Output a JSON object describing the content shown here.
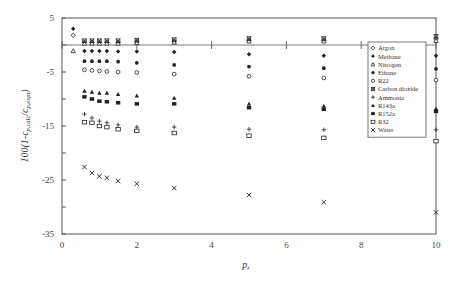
{
  "chart_data": {
    "type": "scatter",
    "title": "",
    "xlabel": "p r",
    "ylabel": "100(1-c p,calc/c p,expt)",
    "xlim": [
      0,
      10
    ],
    "ylim": [
      -35,
      5
    ],
    "x_ticks": [
      "0",
      "2",
      "4",
      "6",
      "8",
      "10"
    ],
    "y_ticks": [
      "5",
      "-5",
      "-15",
      "-25",
      "-35"
    ],
    "grid": false,
    "legend_position": "upper right inside",
    "reference_line_y": 0,
    "series": [
      {
        "name": "Argon",
        "marker": "open-diamond",
        "x": [
          0.3,
          0.6,
          0.8,
          1.0,
          1.2,
          1.5,
          2.0,
          3,
          5,
          7,
          10
        ],
        "y": [
          1.8,
          0.5,
          0.5,
          0.5,
          0.5,
          0.5,
          0.6,
          0.7,
          0.9,
          0.9,
          1.1
        ]
      },
      {
        "name": "Methane",
        "marker": "filled-diamond",
        "x": [
          0.3,
          0.6,
          0.8,
          1.0,
          1.2,
          1.5,
          2.0,
          3,
          5,
          7,
          10
        ],
        "y": [
          3.0,
          -1.1,
          -1.1,
          -1.1,
          -1.1,
          -1.2,
          -1.2,
          -1.3,
          -1.7,
          -2.0,
          -2.0
        ]
      },
      {
        "name": "Nitrogen",
        "marker": "open-triangle",
        "x": [
          0.3,
          0.6,
          0.8,
          1.0,
          1.2,
          1.5,
          2.0,
          3,
          5,
          7,
          10
        ],
        "y": [
          -1.1,
          0.3,
          0.3,
          0.3,
          0.3,
          0.3,
          0.4,
          0.5,
          0.7,
          0.7,
          0.8
        ]
      },
      {
        "name": "Ethane",
        "marker": "filled-circle",
        "x": [
          0.6,
          0.8,
          1.0,
          1.2,
          1.5,
          2.0,
          3,
          5,
          7,
          10
        ],
        "y": [
          -3.0,
          -3.0,
          -3.0,
          -3.0,
          -3.1,
          -3.3,
          -3.7,
          -4.0,
          -4.3,
          -4.4
        ]
      },
      {
        "name": "R22",
        "marker": "open-circle",
        "x": [
          0.6,
          0.8,
          1.0,
          1.2,
          1.5,
          2.0,
          3,
          5,
          7,
          10
        ],
        "y": [
          -4.6,
          -4.7,
          -4.8,
          -4.9,
          -5.0,
          -5.1,
          -5.4,
          -5.8,
          -6.1,
          -6.5
        ]
      },
      {
        "name": "Carbon dioxide",
        "marker": "asterisk",
        "x": [
          0.6,
          0.8,
          1.0,
          1.2,
          1.5,
          2.0,
          3,
          5,
          7,
          10
        ],
        "y": [
          0.8,
          0.8,
          0.8,
          0.8,
          0.8,
          0.9,
          1.0,
          1.2,
          1.2,
          1.6
        ]
      },
      {
        "name": "Ammonia",
        "marker": "plus",
        "x": [
          0.6,
          0.8,
          1.0,
          1.2,
          1.5,
          2.0,
          3,
          5,
          7,
          10
        ],
        "y": [
          -12.8,
          -13.5,
          -14.1,
          -14.4,
          -14.8,
          -15.2,
          -15.2,
          -15.6,
          -15.7,
          -15.7
        ]
      },
      {
        "name": "R143a",
        "marker": "filled-triangle",
        "x": [
          0.6,
          0.8,
          1.0,
          1.2,
          1.5,
          2.0,
          3,
          5,
          7,
          10
        ],
        "y": [
          -8.5,
          -8.7,
          -8.9,
          -8.9,
          -9.1,
          -9.4,
          -9.8,
          -10.9,
          -11.3,
          -11.8
        ]
      },
      {
        "name": "R152a",
        "marker": "filled-square",
        "x": [
          0.6,
          0.8,
          1.0,
          1.2,
          1.5,
          2.0,
          3,
          5,
          7,
          10
        ],
        "y": [
          -9.6,
          -10.0,
          -10.4,
          -10.5,
          -10.7,
          -10.9,
          -10.9,
          -11.6,
          -11.9,
          -12.3
        ]
      },
      {
        "name": "R32",
        "marker": "open-square",
        "x": [
          0.6,
          0.8,
          1.0,
          1.2,
          1.5,
          2.0,
          3,
          5,
          7,
          10
        ],
        "y": [
          -14.3,
          -14.4,
          -15.0,
          -15.2,
          -15.6,
          -15.9,
          -16.3,
          -16.8,
          -17.2,
          -17.8
        ]
      },
      {
        "name": "Water",
        "marker": "cross",
        "x": [
          0.6,
          0.8,
          1.0,
          1.2,
          1.5,
          2.0,
          3,
          5,
          7,
          10
        ],
        "y": [
          -22.6,
          -23.7,
          -24.3,
          -24.6,
          -25.2,
          -25.7,
          -26.5,
          -27.8,
          -29.1,
          -31.0
        ]
      }
    ]
  },
  "axes": {
    "x_label_main": "p",
    "x_label_sub": "r",
    "y_label_main": "100(1-c",
    "y_label_sub1": "p,calc",
    "y_label_mid": "/c",
    "y_label_sub2": "p,expt",
    "y_label_end": ")"
  },
  "legend": {
    "items": [
      "Argon",
      "Methane",
      "Nitrogen",
      "Ethane",
      "R22",
      "Carbon dioxide",
      "Ammonia",
      "R143a",
      "R152a",
      "R32",
      "Water"
    ]
  }
}
